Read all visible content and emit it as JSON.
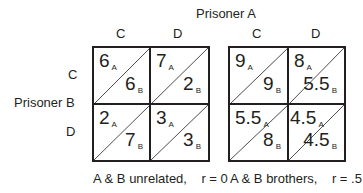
{
  "title_top": "Prisoner A",
  "title_left": "Prisoner B",
  "col_labels": [
    "C",
    "D"
  ],
  "row_labels": [
    "C",
    "D"
  ],
  "sub_a": "A",
  "sub_b": "B",
  "matrices": [
    {
      "caption": "A & B unrelated,    r = 0",
      "cells": [
        {
          "a": "6",
          "b": "6"
        },
        {
          "a": "7",
          "b": "2"
        },
        {
          "a": "2",
          "b": "7"
        },
        {
          "a": "3",
          "b": "3"
        }
      ]
    },
    {
      "caption": "A & B brothers,    r = .5",
      "cells": [
        {
          "a": "9",
          "b": "9"
        },
        {
          "a": "8",
          "b": "5.5"
        },
        {
          "a": "5.5",
          "b": "8"
        },
        {
          "a": "4.5",
          "b": "4.5"
        }
      ]
    }
  ]
}
